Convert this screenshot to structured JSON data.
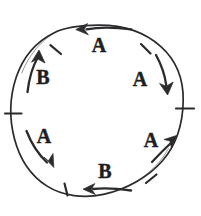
{
  "figure": {
    "background_color": "#ffffff",
    "ink_color": "#2b2b2e",
    "label_color": "#1f1f22"
  },
  "circle": {
    "center_x": 98,
    "center_y": 110,
    "radius": 85,
    "style": "hand-drawn"
  },
  "ticks": [
    {
      "name": "tick-upper-left",
      "angle_deg": 135
    },
    {
      "name": "tick-upper-right",
      "angle_deg": 45
    },
    {
      "name": "tick-left",
      "angle_deg": 180
    },
    {
      "name": "tick-right",
      "angle_deg": 0
    },
    {
      "name": "tick-lower-left",
      "angle_deg": 225
    },
    {
      "name": "tick-lower-right",
      "angle_deg": 315
    }
  ],
  "arrows": [
    {
      "id": "top",
      "label": "A",
      "position": "top",
      "direction": "left",
      "rotation": "counterclockwise",
      "label_x": 99,
      "label_y": 46,
      "tail_x": 130,
      "tail_y": 29,
      "head_x": 82,
      "head_y": 29
    },
    {
      "id": "upper-right",
      "label": "A",
      "position": "upper-right",
      "direction": "down",
      "rotation": "clockwise",
      "label_x": 140,
      "label_y": 80,
      "tail_x": 157,
      "tail_y": 56,
      "head_x": 167,
      "head_y": 88
    },
    {
      "id": "upper-left",
      "label": "B",
      "position": "upper-left",
      "direction": "up",
      "rotation": "clockwise",
      "label_x": 42,
      "label_y": 78,
      "tail_x": 28,
      "tail_y": 90,
      "head_x": 37,
      "head_y": 55
    },
    {
      "id": "lower-left",
      "label": "A",
      "position": "lower-left",
      "direction": "down",
      "rotation": "clockwise",
      "label_x": 43,
      "label_y": 139,
      "tail_x": 27,
      "tail_y": 132,
      "head_x": 49,
      "head_y": 166
    },
    {
      "id": "lower-right",
      "label": "A",
      "position": "lower-right",
      "direction": "up",
      "rotation": "counterclockwise",
      "label_x": 151,
      "label_y": 141,
      "tail_x": 153,
      "tail_y": 160,
      "head_x": 175,
      "head_y": 140
    },
    {
      "id": "bottom",
      "label": "B",
      "position": "bottom",
      "direction": "left",
      "rotation": "clockwise",
      "label_x": 104,
      "label_y": 172,
      "tail_x": 130,
      "tail_y": 190,
      "head_x": 89,
      "head_y": 189
    }
  ]
}
